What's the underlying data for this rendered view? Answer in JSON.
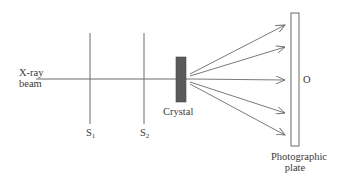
{
  "diagram": {
    "labels": {
      "beam_line1": "X-ray",
      "beam_line2": "beam",
      "slit1": "S",
      "slit1_sub": "1",
      "slit2": "S",
      "slit2_sub": "2",
      "crystal": "Crystal",
      "center_point": "O",
      "plate_line1": "Photographic",
      "plate_line2": "plate"
    },
    "colors": {
      "line": "#6b6b6b",
      "crystal_fill": "#5a5a5a",
      "text": "#3a3a3a"
    },
    "diffracted_rays": 5
  }
}
